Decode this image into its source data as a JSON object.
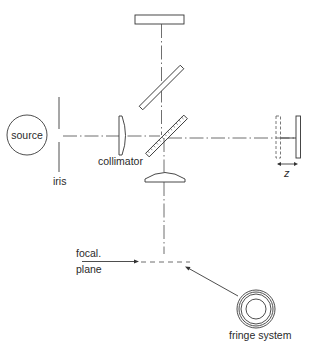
{
  "diagram": {
    "labels": {
      "source": "source",
      "iris": "iris",
      "collimator": "collimator",
      "z": "z",
      "focal_line1": "focal.",
      "focal_line2": "plane",
      "fringe_system": "fringe system"
    },
    "components": [
      {
        "name": "source",
        "shape": "circle"
      },
      {
        "name": "iris",
        "shape": "vertical-line"
      },
      {
        "name": "collimator",
        "shape": "plano-convex-lens"
      },
      {
        "name": "beamsplitter",
        "shape": "hatched-plate"
      },
      {
        "name": "compensator-plate",
        "shape": "plate"
      },
      {
        "name": "fixed-mirror-top",
        "shape": "rectangle"
      },
      {
        "name": "movable-mirror-right",
        "shape": "rectangle"
      },
      {
        "name": "movable-mirror-displaced",
        "shape": "dashed-rectangle"
      },
      {
        "name": "focusing-lens",
        "shape": "plano-convex-lens"
      },
      {
        "name": "focal-plane",
        "shape": "dashed-line"
      },
      {
        "name": "fringe-system",
        "shape": "concentric-rings"
      }
    ],
    "colors": {
      "line": "#3a3a3a",
      "background": "#ffffff"
    }
  }
}
